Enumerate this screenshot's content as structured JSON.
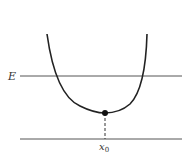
{
  "diagram": {
    "type": "potential-well",
    "labels": {
      "energy": "E",
      "min_x": "x",
      "min_x_sub": "0"
    },
    "colors": {
      "stroke": "#222222",
      "line": "#555555"
    }
  }
}
